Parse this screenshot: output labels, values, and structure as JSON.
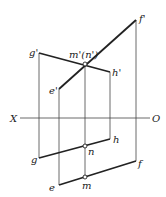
{
  "diagram": {
    "type": "orthographic-projection",
    "axis": {
      "left_label": "X",
      "right_label": "O"
    },
    "points": {
      "f_prime": {
        "label": "f'",
        "x": 136,
        "y": 20
      },
      "g_prime": {
        "label": "g'",
        "x": 39,
        "y": 53
      },
      "m_prime_n_prime": {
        "label": "m'(n')",
        "x": 85,
        "y": 64
      },
      "h_prime": {
        "label": "h'",
        "x": 110,
        "y": 72
      },
      "e_prime": {
        "label": "e'",
        "x": 59,
        "y": 89
      },
      "h": {
        "label": "h",
        "x": 110,
        "y": 139
      },
      "n": {
        "label": "n",
        "x": 85,
        "y": 146
      },
      "g": {
        "label": "g",
        "x": 39,
        "y": 158
      },
      "f": {
        "label": "f",
        "x": 136,
        "y": 161
      },
      "m": {
        "label": "m",
        "x": 85,
        "y": 177
      },
      "e": {
        "label": "e",
        "x": 59,
        "y": 185
      }
    }
  }
}
